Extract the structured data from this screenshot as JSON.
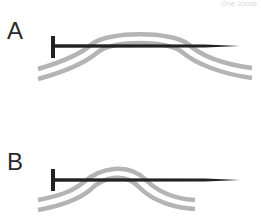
{
  "watermark": "One Jonas",
  "panels": [
    {
      "label": "A",
      "description": "Nail passing over a wide, flattened arch of two gray bands"
    },
    {
      "label": "B",
      "description": "Nail passing over a narrow, peaked arch of two gray bands"
    }
  ],
  "colors": {
    "band": "#b4b4b4",
    "nail": "#222222",
    "label": "#2a2a2a",
    "background": "#ffffff"
  }
}
